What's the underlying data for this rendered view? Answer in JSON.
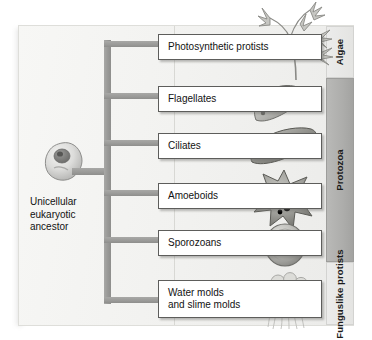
{
  "diagram": {
    "root": {
      "cell_icon": "unicellular-eukaryote-cell-icon",
      "label": "Unicellular\neukaryotic\nancestor"
    },
    "branches": [
      {
        "id": "photosynthetic-protists",
        "label": "Photosynthetic protists",
        "organism_icon": "seaweed-algae-icon",
        "group": "Algae"
      },
      {
        "id": "flagellates",
        "label": "Flagellates",
        "organism_icon": "flagellate-icon",
        "group": "Protozoa"
      },
      {
        "id": "ciliates",
        "label": "Ciliates",
        "organism_icon": "ciliate-icon",
        "group": "Protozoa"
      },
      {
        "id": "amoeboids",
        "label": "Amoeboids",
        "organism_icon": "amoeba-icon",
        "group": "Protozoa"
      },
      {
        "id": "sporozoans",
        "label": "Sporozoans",
        "organism_icon": "sporozoan-icon",
        "group": "Protozoa"
      },
      {
        "id": "water-and-slime-molds",
        "label": "Water molds\nand slime molds",
        "organism_icon": "slime-mold-icon",
        "group": "Funguslike protists"
      }
    ],
    "groups": [
      {
        "id": "algae",
        "label": "Algae"
      },
      {
        "id": "protozoa",
        "label": "Protozoa"
      },
      {
        "id": "funguslike-protists",
        "label": "Funguslike\nprotists"
      }
    ],
    "colors": {
      "panel_background": "#f2f2f0",
      "branch_gray": "#9a9a98",
      "band_gray": "#adadab",
      "band_light": "#e8e8e6",
      "box_border": "#5d5d5b",
      "text": "#121212"
    }
  }
}
